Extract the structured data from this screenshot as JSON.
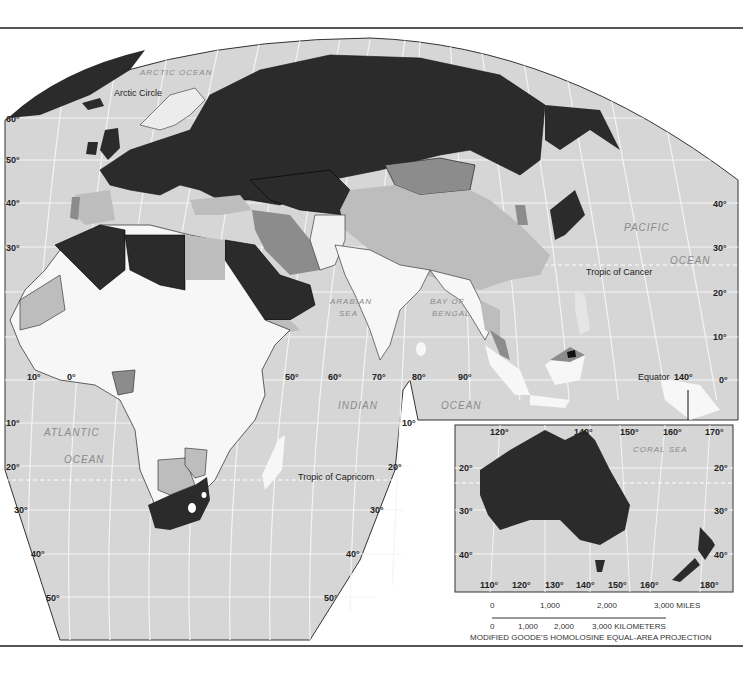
{
  "colors": {
    "ocean": "#d6d6d6",
    "graticule": "#f4f4f4",
    "dark": "#2b2b2b",
    "mid": "#8c8c8c",
    "light": "#bdbdbd",
    "white": "#f7f7f7",
    "border": "#222222"
  },
  "labels": {
    "arctic_ocean": "ARCTIC OCEAN",
    "arctic_circle": "Arctic Circle",
    "pacific": "PACIFIC",
    "ocean_pacific": "OCEAN",
    "tropic_cancer": "Tropic of Cancer",
    "arabian_sea_1": "ARABIAN",
    "arabian_sea_2": "SEA",
    "bay_bengal_1": "BAY OF",
    "bay_bengal_2": "BENGAL",
    "equator": "Equator",
    "indian": "INDIAN",
    "ocean_indian": "OCEAN",
    "atlantic": "ATLANTIC",
    "ocean_atlantic": "OCEAN",
    "tropic_capricorn": "Tropic of Capricorn",
    "coral_sea": "CORAL SEA"
  },
  "left_lat_ticks": [
    "60°",
    "50°",
    "40°",
    "30°",
    "10°",
    "20°",
    "30°",
    "40°",
    "50°"
  ],
  "right_lat_ticks": [
    "40°",
    "30°",
    "20°",
    "10°",
    "0°"
  ],
  "lon_ticks": [
    "10°",
    "0°",
    "50°",
    "60°",
    "70°",
    "80°",
    "90°",
    "140°"
  ],
  "south_right_ticks": [
    "10°",
    "20°",
    "30°",
    "40°",
    "50°"
  ],
  "inset": {
    "top_ticks": [
      "120°",
      "140°",
      "150°",
      "160°",
      "170°"
    ],
    "bottom_ticks": [
      "110°",
      "120°",
      "130°",
      "140°",
      "150°",
      "160°",
      "180°"
    ],
    "left_ticks": [
      "20°",
      "30°",
      "40°"
    ],
    "right_ticks": [
      "20°",
      "30°",
      "40°"
    ]
  },
  "scale_bar": {
    "miles": [
      "0",
      "1,000",
      "2,000",
      "3,000 MILES"
    ],
    "km": [
      "0",
      "1,000",
      "2,000",
      "3,000 KILOMETERS"
    ],
    "projection": "MODIFIED GOODE'S HOMOLOSINE EQUAL-AREA PROJECTION"
  }
}
